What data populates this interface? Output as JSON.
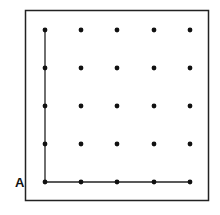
{
  "diagram": {
    "title": "",
    "grid": {
      "rows": 5,
      "cols": 5
    },
    "dot_color": "#111111",
    "line_color": "#222222",
    "frame_color": "#222222",
    "start_label": "A",
    "path": {
      "description": "L-shaped path: up the left column and along the bottom row, both meeting at corner A",
      "segments": [
        {
          "from": [
            0,
            0
          ],
          "to": [
            0,
            4
          ]
        },
        {
          "from": [
            0,
            0
          ],
          "to": [
            4,
            0
          ]
        }
      ]
    }
  }
}
